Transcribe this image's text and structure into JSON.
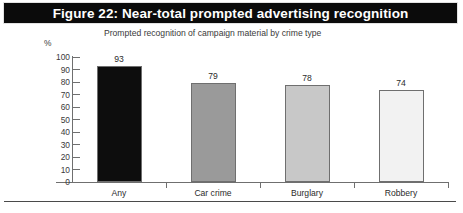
{
  "figure": {
    "title": "Figure 22: Near-total prompted advertising recognition",
    "subtitle": "Prompted recognition of campaign material by crime type",
    "footer_note": ""
  },
  "axis": {
    "unit_label": "%"
  },
  "colors": {
    "banner_background": "#0b0b0b",
    "banner_text": "#ffffff",
    "axis_line": "#6f6f6f",
    "text": "#2b2b2b",
    "bar_any": "#0d0d0d",
    "bar_car_crime": "#9a9a9a",
    "bar_burglary": "#c8c8c8",
    "bar_robbery": "#f2f2f2",
    "bar_outline": "#6f6f6f"
  },
  "chart_data": {
    "type": "bar",
    "title": "Figure 22: Near-total prompted advertising recognition",
    "subtitle": "Prompted recognition of campaign material by crime type",
    "xlabel": "",
    "ylabel": "%",
    "ylim": [
      0,
      100
    ],
    "yticks": [
      0,
      10,
      20,
      30,
      40,
      50,
      60,
      70,
      80,
      90,
      100
    ],
    "ytick_labels": [
      "0",
      "10",
      "20",
      "30",
      "40",
      "50",
      "60",
      "70",
      "80",
      "90",
      "100"
    ],
    "grid": false,
    "legend": false,
    "categories": [
      "Any",
      "Car crime",
      "Burglary",
      "Robbery"
    ],
    "values": [
      93,
      79,
      78,
      74
    ],
    "value_labels": [
      "93",
      "79",
      "78",
      "74"
    ],
    "bar_colors": [
      "#0d0d0d",
      "#9a9a9a",
      "#c8c8c8",
      "#f2f2f2"
    ]
  }
}
